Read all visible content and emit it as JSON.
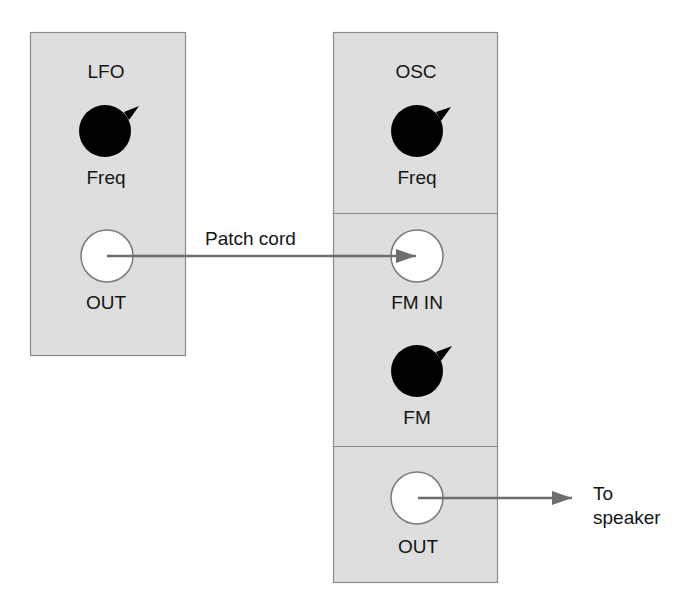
{
  "diagram": {
    "type": "modular-synth-patch",
    "colors": {
      "panel_fill": "#dedede",
      "panel_border": "#8a8a8a",
      "knob": "#000000",
      "jack_fill": "#ffffff",
      "jack_border": "#7a7a7a",
      "cord": "#6e6e6e",
      "text": "#141414"
    },
    "modules": [
      {
        "id": "lfo",
        "title": "LFO",
        "controls": [
          {
            "kind": "knob",
            "label": "Freq"
          },
          {
            "kind": "jack",
            "label": "OUT"
          }
        ]
      },
      {
        "id": "osc",
        "title": "OSC",
        "sections": [
          {
            "controls": [
              {
                "kind": "knob",
                "label": "Freq"
              }
            ]
          },
          {
            "controls": [
              {
                "kind": "jack",
                "label": "FM IN"
              },
              {
                "kind": "knob",
                "label": "FM"
              }
            ]
          },
          {
            "controls": [
              {
                "kind": "jack",
                "label": "OUT"
              }
            ]
          }
        ]
      }
    ],
    "connections": [
      {
        "from": "LFO.OUT",
        "to": "OSC.FM IN",
        "label": "Patch cord"
      },
      {
        "from": "OSC.OUT",
        "to": "speaker",
        "label_line1": "To",
        "label_line2": "speaker"
      }
    ]
  },
  "labels": {
    "lfo_title": "LFO",
    "lfo_freq": "Freq",
    "lfo_out": "OUT",
    "osc_title": "OSC",
    "osc_freq": "Freq",
    "osc_fm_in": "FM IN",
    "osc_fm": "FM",
    "osc_out": "OUT",
    "patch_cord": "Patch cord",
    "to": "To",
    "speaker": "speaker"
  }
}
